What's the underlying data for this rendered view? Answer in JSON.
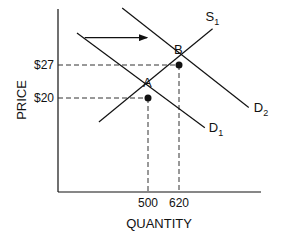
{
  "chart_data": {
    "type": "line",
    "title": "",
    "xlabel": "QUANTITY",
    "ylabel": "PRICE",
    "x_ticks": [
      {
        "value": 500,
        "label": "500"
      },
      {
        "value": 620,
        "label": "620"
      }
    ],
    "y_ticks": [
      {
        "value": 27,
        "label": "$27"
      },
      {
        "value": 20,
        "label": "$20"
      }
    ],
    "grid": false,
    "series": [
      {
        "name": "S1",
        "label_main": "S",
        "label_sub": "1",
        "kind": "supply",
        "points": [
          {
            "x": 310,
            "y": 14.9
          },
          {
            "x": 750,
            "y": 34.7
          }
        ]
      },
      {
        "name": "D1",
        "label_main": "D",
        "label_sub": "1",
        "kind": "demand",
        "points": [
          {
            "x": 225,
            "y": 33.8
          },
          {
            "x": 720,
            "y": 13.7
          }
        ]
      },
      {
        "name": "D2",
        "label_main": "D",
        "label_sub": "2",
        "kind": "demand",
        "points": [
          {
            "x": 400,
            "y": 39.1
          },
          {
            "x": 890,
            "y": 18.0
          }
        ]
      }
    ],
    "equilibria": [
      {
        "name": "A",
        "x": 500,
        "y": 20
      },
      {
        "name": "B",
        "x": 620,
        "y": 27
      }
    ],
    "annotations": [
      {
        "type": "arrow",
        "description": "demand shift right",
        "from": {
          "x": 255,
          "y": 32.8
        },
        "to": {
          "x": 500,
          "y": 32.8
        }
      }
    ],
    "xlim": [
      0,
      1000
    ],
    "ylim": [
      0,
      40
    ]
  }
}
